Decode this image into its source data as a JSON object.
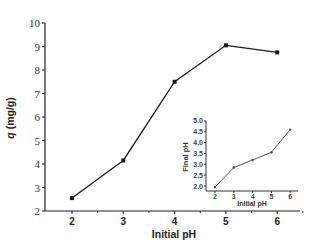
{
  "chart_data": [
    {
      "type": "line",
      "title": "",
      "xlabel": "Initial pH",
      "ylabel": "q (mg/g)",
      "x": [
        2,
        3,
        4,
        5,
        6
      ],
      "values": [
        2.55,
        4.15,
        7.5,
        9.05,
        8.75
      ],
      "xlim": [
        1.6,
        6.5
      ],
      "ylim": [
        2,
        10
      ],
      "xticks": [
        2,
        3,
        4,
        5,
        6
      ],
      "yticks": [
        2,
        3,
        4,
        5,
        6,
        7,
        8,
        9,
        10
      ],
      "marker": "square",
      "grid": false,
      "legend": null
    },
    {
      "type": "line",
      "title": "inset",
      "xlabel": "Initial pH",
      "ylabel": "Final pH",
      "x": [
        2,
        3,
        4,
        5,
        6
      ],
      "values": [
        1.95,
        2.85,
        3.2,
        3.55,
        4.6
      ],
      "xlim": [
        1.6,
        6.5
      ],
      "ylim": [
        1.8,
        5.0
      ],
      "xticks": [
        2,
        3,
        4,
        5,
        6
      ],
      "yticks": [
        "2.0",
        "2.5",
        "3.0",
        "3.5",
        "4.0",
        "4.5",
        "5.0"
      ],
      "marker": "dot",
      "grid": false,
      "legend": null
    }
  ],
  "main": {
    "xlabel": "Initial pH",
    "ylabel_italic": "q",
    "ylabel_unit": " (mg/g)",
    "xticks": [
      "2",
      "3",
      "4",
      "5",
      "6"
    ],
    "yticks": [
      "2",
      "3",
      "4",
      "5",
      "6",
      "7",
      "8",
      "9",
      "10"
    ]
  },
  "inset": {
    "xlabel": "Initial pH",
    "ylabel": "Final pH",
    "xticks": [
      "2",
      "3",
      "4",
      "5",
      "6"
    ],
    "yticks": [
      "2.0",
      "2.5",
      "3.0",
      "3.5",
      "4.0",
      "4.5",
      "5.0"
    ]
  },
  "colors": {
    "line": "#1a1a1a",
    "inset_line": "#555555",
    "axis": "#222222"
  }
}
